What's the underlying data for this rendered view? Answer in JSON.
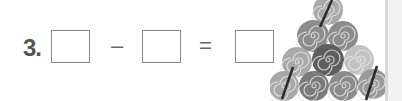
{
  "problem": {
    "number": "3.",
    "operator_minus": "–",
    "operator_equals": "=",
    "boxes": [
      {
        "id": "minuend",
        "value": ""
      },
      {
        "id": "subtrahend",
        "value": ""
      },
      {
        "id": "difference",
        "value": ""
      }
    ]
  },
  "illustration": {
    "subject": "pyramid of spiral hay rolls",
    "rows": [
      1,
      2,
      3,
      4
    ],
    "total": 10,
    "crossed_out": 3,
    "colors": {
      "light": "#a9a9a9",
      "mid": "#8c8c8c",
      "dark": "#5e5e5e",
      "strike": "#2b2b2b"
    }
  }
}
